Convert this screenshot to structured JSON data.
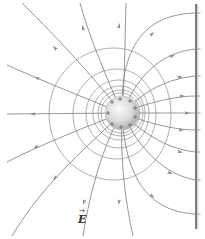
{
  "diagram": {
    "colors": {
      "field_line": "#8a8a8a",
      "equipotential": "#9a9a9a",
      "plate": "#7d7d7d",
      "sphere_light": "#fbfbfb",
      "sphere_dark": "#a9a9a9"
    },
    "sphere": {
      "cx": 122,
      "cy": 113,
      "r": 17,
      "charge_sign": "+",
      "plus_positions": [
        [
          112,
          102
        ],
        [
          120,
          99
        ],
        [
          130,
          101
        ],
        [
          135,
          108
        ],
        [
          108,
          113
        ],
        [
          135,
          117
        ],
        [
          112,
          124
        ],
        [
          121,
          127
        ],
        [
          130,
          125
        ]
      ]
    },
    "plate": {
      "x": 196,
      "y1": 4,
      "y2": 229,
      "charge_sign": "-",
      "minus_positions": [
        13,
        49,
        76,
        96,
        113,
        130,
        152,
        180,
        214
      ]
    },
    "equipotentials": [
      {
        "cx": 114,
        "cy": 114,
        "rx": 65,
        "ry": 66,
        "shift": 8
      },
      {
        "cx": 117,
        "cy": 114,
        "rx": 44,
        "ry": 45,
        "shift": 5
      },
      {
        "cx": 119,
        "cy": 114,
        "rx": 33,
        "ry": 34,
        "shift": 3
      },
      {
        "cx": 120,
        "cy": 113,
        "rx": 27,
        "ry": 27,
        "shift": 2
      },
      {
        "cx": 121,
        "cy": 113,
        "rx": 23,
        "ry": 23,
        "shift": 1
      },
      {
        "cx": 121,
        "cy": 113,
        "rx": 20,
        "ry": 20,
        "shift": 1
      }
    ],
    "field_lines": [
      {
        "d": "M122,113 L7,114",
        "arrow": [
          33,
          114,
          180
        ]
      },
      {
        "d": "M122,113 C90,100 40,80 7,65",
        "arrow": [
          37,
          78,
          200
        ]
      },
      {
        "d": "M122,113 C100,85 60,40 22,3",
        "arrow": [
          55,
          48,
          225
        ]
      },
      {
        "d": "M122,113 C108,80 90,40 80,3",
        "arrow": [
          83,
          28,
          255
        ]
      },
      {
        "d": "M122,113 C125,80 125,30 126,3",
        "arrow": [
          119,
          26,
          280
        ]
      },
      {
        "d": "M122,113 C120,40 150,14 196,13",
        "arrow": [
          152,
          34,
          320
        ]
      },
      {
        "d": "M122,113 C140,70 165,52 196,49",
        "arrow": [
          172,
          56,
          340
        ]
      },
      {
        "d": "M122,113 C150,85 175,78 196,76",
        "arrow": [
          180,
          77,
          355
        ]
      },
      {
        "d": "M122,113 C155,100 180,96 196,96",
        "arrow": [
          182,
          96,
          0
        ]
      },
      {
        "d": "M122,113 L196,113",
        "arrow": [
          187,
          113,
          0
        ]
      },
      {
        "d": "M122,113 C155,126 180,130 196,130",
        "arrow": [
          181,
          130,
          5
        ]
      },
      {
        "d": "M122,113 C150,140 175,150 196,152",
        "arrow": [
          180,
          152,
          10
        ]
      },
      {
        "d": "M122,113 C140,150 165,175 196,180",
        "arrow": [
          170,
          173,
          25
        ]
      },
      {
        "d": "M122,113 C125,180 150,212 196,214",
        "arrow": [
          152,
          196,
          45
        ]
      },
      {
        "d": "M122,113 C120,160 125,200 133,236",
        "arrow": [
          119,
          202,
          95
        ]
      },
      {
        "d": "M122,113 C105,140 90,190 83,236",
        "arrow": [
          84,
          202,
          100
        ]
      },
      {
        "d": "M122,113 C95,140 45,180 12,236",
        "arrow": [
          55,
          178,
          125
        ]
      },
      {
        "d": "M122,113 C90,125 40,145 7,162",
        "arrow": [
          36,
          147,
          155
        ]
      }
    ],
    "label": {
      "text": "E",
      "vector_arrow": "→",
      "x": 78,
      "y": 214
    }
  }
}
